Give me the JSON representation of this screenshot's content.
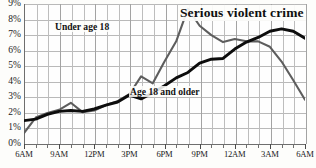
{
  "chart_data": {
    "type": "line",
    "title": "Serious violent crime",
    "xlabel": "",
    "ylabel": "",
    "ylim": [
      0,
      9
    ],
    "ytick_labels": [
      "0%",
      "1%",
      "2%",
      "3%",
      "4%",
      "5%",
      "6%",
      "7%",
      "8%",
      "9%"
    ],
    "ytick_values": [
      0,
      1,
      2,
      3,
      4,
      5,
      6,
      7,
      8,
      9
    ],
    "xtick_labels": [
      "6AM",
      "9AM",
      "12PM",
      "3PM",
      "6PM",
      "9PM",
      "12AM",
      "3AM",
      "6AM"
    ],
    "xtick_values": [
      0,
      3,
      6,
      9,
      12,
      15,
      18,
      21,
      24
    ],
    "x_hours": [
      0,
      1,
      2,
      3,
      4,
      5,
      6,
      7,
      8,
      9,
      10,
      11,
      12,
      13,
      14,
      15,
      16,
      17,
      18,
      19,
      20,
      21,
      22,
      23,
      24
    ],
    "grid": true,
    "legend_position": "inline-annotations",
    "series": [
      {
        "name": "Under age 18",
        "color": "#5d5d5d",
        "label_x_hour": 3.0,
        "label_y_pct": 7.9,
        "values": [
          0.7,
          1.7,
          2.0,
          2.2,
          2.65,
          2.05,
          2.15,
          2.5,
          2.75,
          3.2,
          4.35,
          3.9,
          5.3,
          6.6,
          8.7,
          7.6,
          7.0,
          6.55,
          6.75,
          6.6,
          6.6,
          6.25,
          5.3,
          4.1,
          2.85
        ]
      },
      {
        "name": "Age 18 and older",
        "color": "#0d0d0d",
        "label_x_hour": 9.5,
        "label_y_pct": 3.45,
        "values": [
          1.5,
          1.6,
          1.9,
          2.1,
          2.15,
          2.1,
          2.25,
          2.5,
          2.7,
          3.15,
          2.9,
          3.3,
          3.75,
          4.25,
          4.6,
          5.2,
          5.45,
          5.5,
          6.1,
          6.55,
          6.85,
          7.25,
          7.4,
          7.25,
          6.8
        ]
      }
    ],
    "series_tail": {
      "Under age 18": {
        "x_hours": [
          24,
          25,
          26,
          27,
          28
        ],
        "values": [
          2.85,
          1.6,
          0.85,
          0.6,
          0.55
        ]
      },
      "Age 18 and older": {
        "x_hours": [
          24,
          25,
          26,
          27,
          28
        ],
        "values": [
          6.8,
          5.3,
          3.4,
          2.0,
          1.3
        ]
      }
    },
    "annotations": [
      {
        "text": "Under age 18",
        "kind": "series-label"
      },
      {
        "text": "Age 18 and older",
        "kind": "series-label"
      }
    ]
  }
}
